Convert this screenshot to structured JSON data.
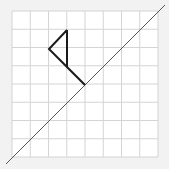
{
  "diagram": {
    "grid": {
      "x0": 12,
      "y0": 11,
      "cell": 18.25,
      "cols": 8,
      "rows": 8,
      "line_color": "#d4d4d4",
      "bg": "#ffffff"
    },
    "shape": {
      "points": [
        [
          67,
          30
        ],
        [
          49,
          49
        ],
        [
          67,
          67
        ],
        [
          85,
          85
        ],
        [
          67,
          67
        ],
        [
          67,
          30
        ]
      ],
      "stroke": "#1a1a1a"
    },
    "reflection_line": {
      "x1": 6,
      "y1": 164,
      "x2": 165,
      "y2": 5,
      "stroke": "#555555"
    }
  }
}
